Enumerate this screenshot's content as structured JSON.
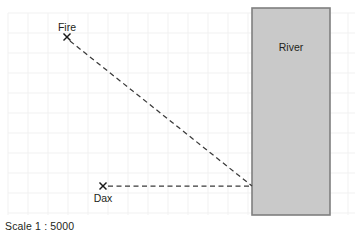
{
  "figure": {
    "type": "scale-map-diagram",
    "background_color": "#ffffff",
    "caption": "Scale 1 : 5000"
  },
  "grid": {
    "visible": true,
    "line_color": "#f1f1f1",
    "spacing_px": 20,
    "x_start": 8,
    "x_end": 355,
    "y_start": 13,
    "y_end": 215
  },
  "river": {
    "label": "River",
    "fill_color": "#c9c9c9",
    "border_color": "#7f7f7f",
    "x": 252,
    "y": 8,
    "width": 78,
    "height": 207,
    "label_x": 291,
    "label_y": 51
  },
  "points": [
    {
      "id": "fire",
      "label": "Fire",
      "marker": "x-cross-marker",
      "x": 67,
      "y": 37,
      "label_x": 67,
      "label_y": 31,
      "label_anchor": "middle"
    },
    {
      "id": "dax",
      "label": "Dax",
      "marker": "x-cross-marker",
      "x": 103,
      "y": 186,
      "label_x": 103,
      "label_y": 202,
      "label_anchor": "middle"
    }
  ],
  "lines": [
    {
      "id": "fire-to-river",
      "style": "dashed",
      "color": "#3a3a3a",
      "x1": 70,
      "y1": 41,
      "x2": 252,
      "y2": 186
    },
    {
      "id": "dax-to-river",
      "style": "dashed",
      "color": "#3a3a3a",
      "x1": 108,
      "y1": 186,
      "x2": 252,
      "y2": 186
    }
  ],
  "chart_data": {
    "type": "scatter",
    "title": "",
    "xlabel": "",
    "ylabel": "",
    "scale": "Scale 1 : 5000",
    "grid": true,
    "grid_spacing_px": 20,
    "categories": [
      "Fire",
      "Dax",
      "River"
    ],
    "annotations": [
      "Fire",
      "Dax",
      "River",
      "Scale 1 : 5000"
    ],
    "series": [
      {
        "name": "locations",
        "points": [
          {
            "label": "Fire",
            "x": 67,
            "y": 37
          },
          {
            "label": "Dax",
            "x": 103,
            "y": 186
          }
        ]
      },
      {
        "name": "construction-lines",
        "points": [
          {
            "label": "fire-to-riverbank",
            "x": 252,
            "y": 186
          },
          {
            "label": "dax-to-riverbank",
            "x": 252,
            "y": 186
          }
        ]
      }
    ]
  }
}
